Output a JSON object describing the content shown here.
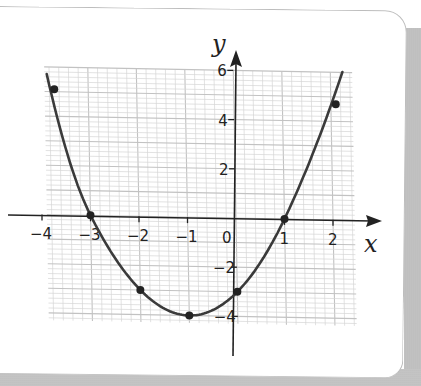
{
  "chart_data": {
    "type": "line",
    "title": "",
    "xlabel": "x",
    "ylabel": "y",
    "xlim": [
      -4.2,
      2.5
    ],
    "ylim": [
      -5.0,
      6.6
    ],
    "grid": true,
    "grid_minor_step": 0.2,
    "x_ticks": [
      -4,
      -3,
      -2,
      -1,
      0,
      1,
      2
    ],
    "x_tick_labels": [
      "−4",
      "−3",
      "−2",
      "−1",
      "0",
      "1",
      "2"
    ],
    "y_ticks": [
      -4,
      -2,
      2,
      4,
      6
    ],
    "y_tick_labels": [
      "−4",
      "−2",
      "2",
      "4",
      "6"
    ],
    "series": [
      {
        "name": "parabola",
        "curve": "quadratic",
        "equation_approx": "y = x^2 + 2x - 3",
        "marked_points": [
          {
            "x": -3.7,
            "y": 5.1
          },
          {
            "x": -3,
            "y": 0
          },
          {
            "x": -2,
            "y": -3
          },
          {
            "x": -1,
            "y": -4
          },
          {
            "x": 0,
            "y": -3
          },
          {
            "x": 1,
            "y": 0
          },
          {
            "x": 2.1,
            "y": 4.7
          }
        ]
      }
    ]
  },
  "labels": {
    "x_axis": "x",
    "y_axis": "y",
    "origin": "0"
  },
  "colors": {
    "curve": "#3a3a3a",
    "grid": "#d6d6d6",
    "grid_major": "#c2c2c2",
    "axis": "#222222",
    "shadow": "#bdbdbd"
  }
}
